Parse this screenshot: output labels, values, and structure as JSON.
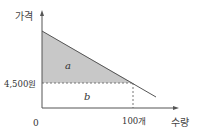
{
  "diagram": {
    "type": "consumer-surplus-demand-curve",
    "y_axis_label": "가격",
    "x_axis_label": "수량",
    "origin_label": "0",
    "price_label": "4,500원",
    "quantity_label": "100개",
    "region_a_label": "a",
    "region_b_label": "b",
    "colors": {
      "axis": "#555555",
      "demand_line": "#555555",
      "region_a_fill": "#c8c8c8",
      "dashed_line": "#777777"
    }
  }
}
